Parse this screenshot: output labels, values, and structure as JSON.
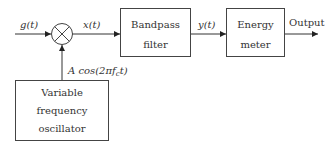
{
  "diagram": {
    "type": "block-diagram",
    "input_signal": {
      "label": "g(t)"
    },
    "multiplier": {
      "symbol": "×"
    },
    "mixer_output": {
      "label": "x(t)"
    },
    "blocks": [
      {
        "id": "bandpass",
        "line1": "Bandpass",
        "line2": "filter"
      },
      {
        "id": "energy",
        "line1": "Energy",
        "line2": "meter"
      },
      {
        "id": "oscillator",
        "line1": "Variable",
        "line2": "frequency",
        "line3": "oscillator"
      }
    ],
    "filter_output": {
      "label": "y(t)"
    },
    "final_output": {
      "label": "Output"
    },
    "oscillator_signal": {
      "label": "A cos(2πf_c t)",
      "prefix": "A cos(2π",
      "f": "f",
      "sub": "c",
      "suffix": "t)"
    },
    "colors": {
      "stroke": "#333333",
      "background": "#ffffff"
    }
  }
}
